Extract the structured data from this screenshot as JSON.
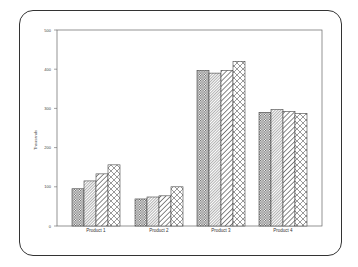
{
  "chart_data": {
    "type": "bar",
    "title": "",
    "xlabel": "",
    "ylabel": "Thousands",
    "ylim": [
      0,
      500
    ],
    "yticks": [
      0,
      100,
      200,
      300,
      400,
      500
    ],
    "categories": [
      "Product 1",
      "Product 2",
      "Product 3",
      "Product 4"
    ],
    "series": [
      {
        "name": "Series 1",
        "pattern": "checker",
        "values": [
          95,
          69,
          397,
          290
        ]
      },
      {
        "name": "Series 2",
        "pattern": "dense-diagonal",
        "values": [
          115,
          74,
          390,
          297
        ]
      },
      {
        "name": "Series 3",
        "pattern": "wide-diagonal",
        "values": [
          133,
          77,
          397,
          292
        ]
      },
      {
        "name": "Series 4",
        "pattern": "crosshatch",
        "values": [
          156,
          100,
          420,
          287
        ]
      }
    ],
    "grid": false,
    "legend": "none"
  },
  "colors": {
    "border": "#333333",
    "axis": "#555555",
    "bar_fill": "#ffffff",
    "pattern_stroke": "#555555"
  }
}
